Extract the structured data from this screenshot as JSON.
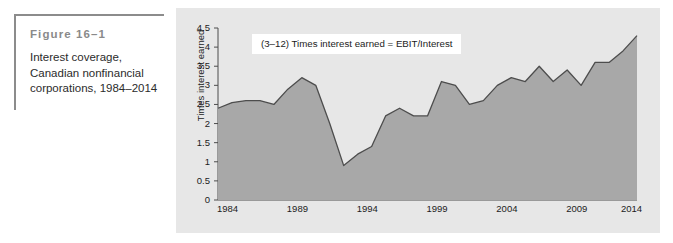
{
  "figure": {
    "number": "Figure 16–1",
    "caption": "Interest coverage, Canadian nonfinancial corporations, 1984–2014"
  },
  "chart_data": {
    "type": "area",
    "title": "",
    "subtitle": "",
    "xlabel": "",
    "ylabel": "Times interest earned",
    "annotation": "(3–12) Times interest earned = EBIT/Interest",
    "grid": false,
    "legend": "none",
    "xlim": [
      1984,
      2014
    ],
    "ylim": [
      0,
      4.5
    ],
    "ytick_labels": [
      "0",
      "0.5",
      "1",
      "1.5",
      "2",
      "2.5",
      "3",
      "3.5",
      "4",
      "4.5"
    ],
    "ytick_values": [
      0,
      0.5,
      1,
      1.5,
      2,
      2.5,
      3,
      3.5,
      4,
      4.5
    ],
    "xtick_labels": [
      "1984",
      "1989",
      "1994",
      "1999",
      "2004",
      "2009",
      "2014"
    ],
    "xtick_values": [
      1984,
      1989,
      1994,
      1999,
      2004,
      2009,
      2014
    ],
    "area_color": "#a8a8a8",
    "line_color": "#4d4d4d",
    "panel_color": "#e7e7e7",
    "series": [
      {
        "name": "Times interest earned",
        "x": [
          1984,
          1985,
          1986,
          1987,
          1988,
          1989,
          1990,
          1991,
          1992,
          1993,
          1994,
          1995,
          1996,
          1997,
          1998,
          1999,
          2000,
          2001,
          2002,
          2003,
          2004,
          2005,
          2006,
          2007,
          2008,
          2009,
          2010,
          2011,
          2012,
          2013,
          2014
        ],
        "values": [
          2.4,
          2.55,
          2.6,
          2.6,
          2.5,
          2.9,
          3.2,
          3.0,
          2.0,
          0.9,
          1.2,
          1.4,
          2.2,
          2.4,
          2.2,
          2.2,
          3.1,
          3.0,
          2.5,
          2.6,
          3.0,
          3.2,
          3.1,
          3.5,
          3.1,
          3.4,
          3.0,
          3.6,
          3.6,
          3.9,
          4.3
        ]
      }
    ]
  }
}
